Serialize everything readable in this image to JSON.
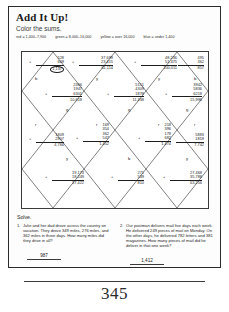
{
  "worksheet": {
    "title": "Add It Up!",
    "subtitle": "Color the sums.",
    "page_number": "345"
  },
  "legend": [
    "red = 1,400–7,900",
    "green = 8,000–16,000",
    "yellow = over 16,000",
    "blue = under 1,400"
  ],
  "grid": {
    "problems": [
      {
        "id": "p1",
        "addends": [
          "528",
          "609"
        ],
        "sum": "1,137",
        "sum_circled": true,
        "tag": "b"
      },
      {
        "id": "p2",
        "addends": [
          "37,699",
          "23,415"
        ],
        "sum": "61,114",
        "tag": "y"
      },
      {
        "id": "p3",
        "addends": [
          "48,236",
          "51,775"
        ],
        "sum": "100,011",
        "tag": "y"
      },
      {
        "id": "p4",
        "addends": [
          "495",
          "362"
        ],
        "sum": "857",
        "tag": "b"
      },
      {
        "id": "p5",
        "addends": [
          "2366",
          "1947",
          "6301"
        ],
        "sum": "10,618",
        "tag": "g"
      },
      {
        "id": "p6",
        "addends": [
          "5151",
          "4309",
          "1878"
        ],
        "sum": "11,338",
        "tag": "g"
      },
      {
        "id": "p7",
        "addends": [
          "3942",
          "5836",
          "6218"
        ],
        "sum": "15,996",
        "tag": "g"
      },
      {
        "id": "p8",
        "addends": [
          "1809",
          "2907"
        ],
        "sum": "4,766",
        "tag": "r"
      },
      {
        "id": "p9",
        "addends": [
          "169",
          "354",
          "362",
          "547"
        ],
        "sum": "1,452",
        "tag": "r"
      },
      {
        "id": "p10",
        "addends": [
          "218",
          "396",
          "178",
          "682"
        ],
        "sum": "1,474",
        "tag": "r"
      },
      {
        "id": "p11",
        "addends": [
          "5883",
          "1859"
        ],
        "sum": "7,742",
        "tag": "r"
      },
      {
        "id": "p12",
        "addends": [
          "19,173",
          "18,249"
        ],
        "sum": "37,422",
        "tag": "y"
      },
      {
        "id": "p13",
        "addends": [
          "271",
          "539"
        ],
        "sum": "810",
        "tag": "b"
      },
      {
        "id": "p14",
        "addends": [
          "27,468",
          "35,788"
        ],
        "sum": "63,256",
        "tag": "y"
      }
    ]
  },
  "solve": {
    "heading": "Solve.",
    "items": [
      {
        "number": "1.",
        "text": "Julie and her dad drove across the country on vacation. They drove 349 miles, 276 miles, and 362 miles in three days. How many miles did they drive in all?",
        "answer": "987"
      },
      {
        "number": "2.",
        "text": "Our postman delivers mail five days each week. He delivered 249 pieces of mail on Monday. On the other days, he delivered 782 letters and 381 magazines. How many pieces of mail did he deliver in that one week?",
        "answer": "1,412"
      }
    ]
  }
}
